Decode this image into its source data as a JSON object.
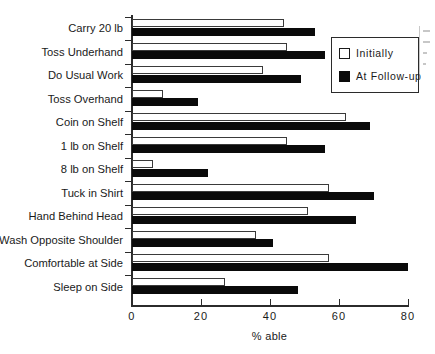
{
  "chart_data": {
    "type": "bar",
    "orientation": "horizontal",
    "title": "",
    "xlabel": "% able",
    "ylabel": "",
    "xlim": [
      0,
      80
    ],
    "xticks": [
      0,
      20,
      40,
      60,
      80
    ],
    "xtick_labels": [
      "0",
      "20",
      "40",
      "60",
      "80"
    ],
    "grid": false,
    "legend_position": "top-right",
    "categories": [
      "Carry 20 lb",
      "Toss Underhand",
      "Do Usual Work",
      "Toss Overhand",
      "Coin on Shelf",
      "1 lb on Shelf",
      "8 lb on Shelf",
      "Tuck in Shirt",
      "Hand Behind Head",
      "Wash Opposite Shoulder",
      "Comfortable at Side",
      "Sleep on Side"
    ],
    "series": [
      {
        "name": "Initially",
        "color": "#ffffff",
        "edge_color": "#3a3a3a",
        "values": [
          44,
          45,
          38,
          9,
          62,
          45,
          6,
          57,
          51,
          36,
          57,
          27
        ]
      },
      {
        "name": "At Follow-up",
        "color": "#0a0a0a",
        "edge_color": "#0a0a0a",
        "values": [
          53,
          56,
          49,
          19,
          69,
          56,
          22,
          70,
          65,
          41,
          80,
          48
        ]
      }
    ]
  },
  "legend": {
    "items": [
      {
        "label": "Initially",
        "swatch": "white-square-outline"
      },
      {
        "label": "At Follow-up",
        "swatch": "black-filled-square"
      }
    ]
  },
  "axis": {
    "x_title": "% able"
  }
}
